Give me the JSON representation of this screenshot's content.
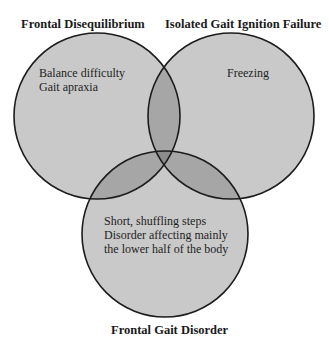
{
  "diagram": {
    "type": "venn-3",
    "colors": {
      "background": "#ffffff",
      "single": "#c9c9c9",
      "double": "#a6a6a6",
      "triple": "#8c8c8c",
      "stroke": "#1c1c1c"
    },
    "sets": [
      {
        "id": "frontal-disequilibrium",
        "title": "Frontal Disequilibrium",
        "items": [
          "Balance difficulty",
          "Gait apraxia"
        ]
      },
      {
        "id": "isolated-gait-ignition-failure",
        "title": "Isolated Gait Ignition Failure",
        "items": [
          "Freezing"
        ]
      },
      {
        "id": "frontal-gait-disorder",
        "title": "Frontal Gait Disorder",
        "items": [
          "Short, shuffling steps",
          "Disorder affecting mainly",
          "the lower half of the body"
        ]
      }
    ]
  }
}
